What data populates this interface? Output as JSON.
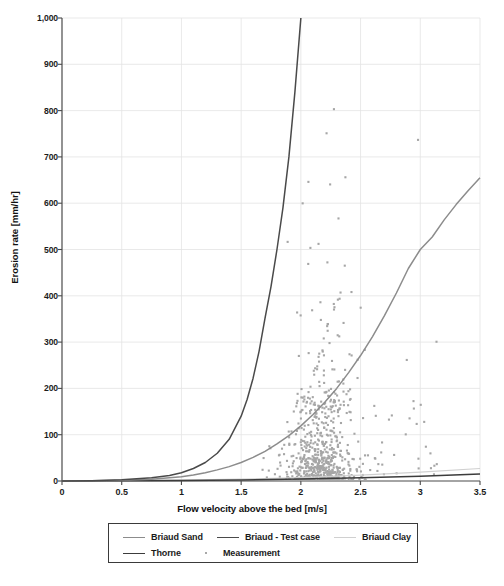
{
  "chart_data": {
    "type": "scatter",
    "title": "",
    "xlabel": "Flow velocity above the bed [m/s]",
    "ylabel": "Erosion rate [mm/hr]",
    "xlim": [
      0,
      3.5
    ],
    "ylim": [
      0,
      1000
    ],
    "xticks": [
      "0",
      "0.5",
      "1",
      "1.5",
      "2",
      "2.5",
      "3",
      "3.5"
    ],
    "xtick_values": [
      0,
      0.5,
      1,
      1.5,
      2,
      2.5,
      3,
      3.5
    ],
    "yticks": [
      "0",
      "100",
      "200",
      "300",
      "400",
      "500",
      "600",
      "700",
      "800",
      "900",
      "1,000"
    ],
    "ytick_values": [
      0,
      100,
      200,
      300,
      400,
      500,
      600,
      700,
      800,
      900,
      1000
    ],
    "grid": true,
    "legend_position": "bottom-outside",
    "legend_entries": [
      {
        "name": "Briaud Sand",
        "marker": "line",
        "color": "#8c8c8c"
      },
      {
        "name": "Briaud - Test case",
        "marker": "line",
        "color": "#4a4a4a"
      },
      {
        "name": "Briaud Clay",
        "marker": "line",
        "color": "#d0d0d0"
      },
      {
        "name": "Thorne",
        "marker": "line",
        "color": "#3c3c3c"
      },
      {
        "name": "Measurement",
        "marker": "dot",
        "color": "#a8a8a8"
      }
    ],
    "series": [
      {
        "name": "Briaud Sand",
        "type": "line",
        "color": "#8c8c8c",
        "x": [
          0,
          0.25,
          0.5,
          0.75,
          1.0,
          1.1,
          1.2,
          1.3,
          1.4,
          1.5,
          1.6,
          1.7,
          1.8,
          1.9,
          2.0,
          2.1,
          2.2,
          2.3,
          2.4,
          2.5,
          2.6,
          2.7,
          2.8,
          2.9,
          3.0,
          3.1,
          3.2,
          3.3,
          3.4,
          3.5
        ],
        "values": [
          0,
          0.4,
          1.5,
          4,
          9,
          13,
          18,
          24,
          31,
          40,
          51,
          64,
          80,
          98,
          119,
          143,
          170,
          200,
          234,
          271,
          312,
          357,
          406,
          459,
          500,
          527,
          564,
          597,
          627,
          655
        ]
      },
      {
        "name": "Briaud - Test case",
        "type": "line",
        "color": "#4a4a4a",
        "x": [
          0,
          0.25,
          0.5,
          0.75,
          0.9,
          1.0,
          1.1,
          1.2,
          1.3,
          1.4,
          1.5,
          1.55,
          1.6,
          1.65,
          1.7,
          1.75,
          1.8,
          1.85,
          1.9,
          1.95,
          2.0
        ],
        "values": [
          0,
          0.6,
          2.5,
          7,
          12,
          18,
          27,
          40,
          60,
          90,
          140,
          176,
          222,
          280,
          352,
          420,
          500,
          590,
          700,
          840,
          1000
        ]
      },
      {
        "name": "Briaud Clay",
        "type": "line",
        "color": "#d0d0d0",
        "x": [
          0,
          0.5,
          1.0,
          1.5,
          2.0,
          2.5,
          3.0,
          3.5
        ],
        "values": [
          0,
          0.6,
          1.8,
          4,
          7.5,
          12.5,
          19,
          27
        ]
      },
      {
        "name": "Thorne",
        "type": "line",
        "color": "#3c3c3c",
        "x": [
          0,
          0.5,
          1.0,
          1.5,
          2.0,
          2.5,
          3.0,
          3.5
        ],
        "values": [
          0,
          0.5,
          1.2,
          2.4,
          4.2,
          7.0,
          10.5,
          15.0
        ]
      },
      {
        "name": "Measurement",
        "type": "scatter",
        "color": "#a8a8a8",
        "n_points": 760,
        "x_range": [
          1.6,
          3.25
        ],
        "y_range": [
          2,
          935
        ],
        "note": "Dense cluster of small gray square markers concentrated between 1.9 and 2.6 m/s with erosion rates mostly below 200 mm/hr; sparse outliers up to about 935 mm/hr near 3.0 m/s."
      }
    ]
  }
}
